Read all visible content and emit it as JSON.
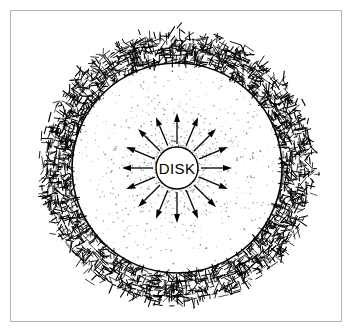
{
  "figure": {
    "width": 354,
    "height": 334,
    "background_color": "#ffffff",
    "frame": {
      "inset": 10,
      "border_color": "#b4b4b4",
      "border_width": 1
    }
  },
  "labels": {
    "center_disk": "DISK"
  },
  "diagram": {
    "type": "schematic-cross-section",
    "center": {
      "x": 177,
      "y": 168
    },
    "center_disk": {
      "radius": 21,
      "fill": "#ffffff",
      "stroke": "#000000",
      "stroke_width": 1.4
    },
    "inner_region": {
      "radius": 105,
      "fill": "#ffffff",
      "stroke": "#000000",
      "stroke_width": 1.6,
      "texture": "stipple",
      "stipple_color": "#555555",
      "stipple_count": 900,
      "stipple_density_falloff": "decreasing-outward"
    },
    "outer_ring": {
      "inner_radius": 105,
      "outer_radius": 140,
      "texture": "cross-hatch-dashes",
      "dash_color": "#000000",
      "dash_count": 2600,
      "dash_length_min": 3,
      "dash_length_max": 11,
      "edge_inner": "sharp",
      "edge_outer": "irregular"
    },
    "arrows": {
      "count": 16,
      "angle_step_degrees": 22.5,
      "start_radius": 24,
      "end_radius": 55,
      "color": "#000000",
      "shaft_width": 1.3,
      "head_length": 9,
      "head_width": 6,
      "direction": "outward-radial"
    }
  }
}
